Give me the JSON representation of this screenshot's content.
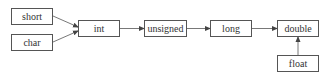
{
  "diagram": {
    "title": "",
    "nodes": [
      {
        "id": "short",
        "label": "short",
        "x": 11,
        "y": 8,
        "w": 42,
        "h": 17
      },
      {
        "id": "char",
        "label": "char",
        "x": 11,
        "y": 34,
        "w": 42,
        "h": 17
      },
      {
        "id": "int",
        "label": "int",
        "x": 78,
        "y": 20,
        "w": 42,
        "h": 17
      },
      {
        "id": "unsigned",
        "label": "unsigned",
        "x": 144,
        "y": 20,
        "w": 43,
        "h": 17
      },
      {
        "id": "long",
        "label": "long",
        "x": 210,
        "y": 20,
        "w": 42,
        "h": 17
      },
      {
        "id": "double",
        "label": "double",
        "x": 277,
        "y": 20,
        "w": 42,
        "h": 17
      },
      {
        "id": "float",
        "label": "float",
        "x": 277,
        "y": 55,
        "w": 42,
        "h": 17
      }
    ],
    "edges": [
      {
        "from": "short",
        "to": "int"
      },
      {
        "from": "char",
        "to": "int"
      },
      {
        "from": "int",
        "to": "unsigned"
      },
      {
        "from": "unsigned",
        "to": "long"
      },
      {
        "from": "long",
        "to": "double"
      },
      {
        "from": "float",
        "to": "double"
      }
    ],
    "colors": {
      "stroke": "#555555",
      "text": "#333333",
      "background": "#ffffff"
    }
  }
}
